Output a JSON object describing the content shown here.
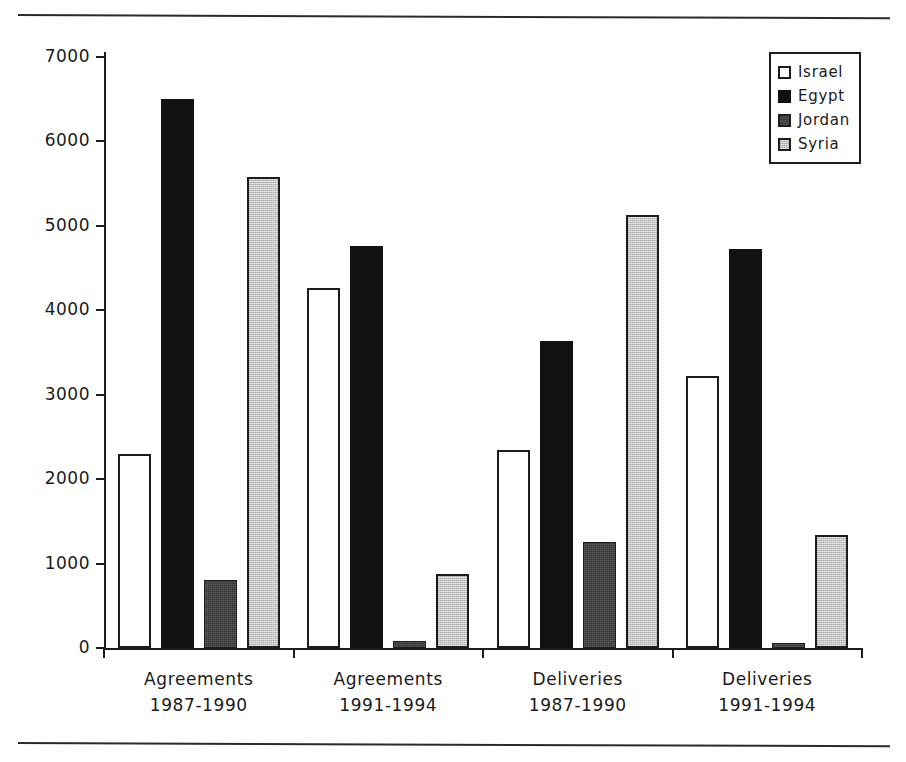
{
  "chart_data": {
    "type": "bar",
    "title": "",
    "subtitle": "",
    "xlabel": "",
    "ylabel": "",
    "ylim": [
      0,
      7000
    ],
    "yticks": [
      0,
      1000,
      2000,
      3000,
      4000,
      5000,
      6000,
      7000
    ],
    "ytick_labels": [
      "0",
      "1000",
      "2000",
      "3000",
      "4000",
      "5000",
      "6000",
      "7000"
    ],
    "grid": false,
    "legend_position": "top-right",
    "categories": [
      "Agreements 1987-1990",
      "Agreements 1991-1994",
      "Deliveries 1987-1990",
      "Deliveries 1991-1994"
    ],
    "category_lines": [
      {
        "line1": "Agreements",
        "line2": "1987-1990"
      },
      {
        "line1": "Agreements",
        "line2": "1991-1994"
      },
      {
        "line1": "Deliveries",
        "line2": "1987-1990"
      },
      {
        "line1": "Deliveries",
        "line2": "1991-1994"
      }
    ],
    "series": [
      {
        "name": "Israel",
        "key": "israel",
        "color": "#ffffff",
        "values": [
          2300,
          4260,
          2350,
          3220
        ]
      },
      {
        "name": "Egypt",
        "key": "egypt",
        "color": "#111111",
        "values": [
          6500,
          4760,
          3640,
          4730
        ]
      },
      {
        "name": "Jordan",
        "key": "jordan",
        "color": "#3a3a3a",
        "values": [
          800,
          80,
          1250,
          60
        ]
      },
      {
        "name": "Syria",
        "key": "syria",
        "color": "#c4c4c4",
        "values": [
          5580,
          880,
          5130,
          1340
        ]
      }
    ]
  },
  "legend": {
    "items": [
      {
        "label": "Israel",
        "key": "israel"
      },
      {
        "label": "Egypt",
        "key": "egypt"
      },
      {
        "label": "Jordan",
        "key": "jordan"
      },
      {
        "label": "Syria",
        "key": "syria"
      }
    ]
  }
}
